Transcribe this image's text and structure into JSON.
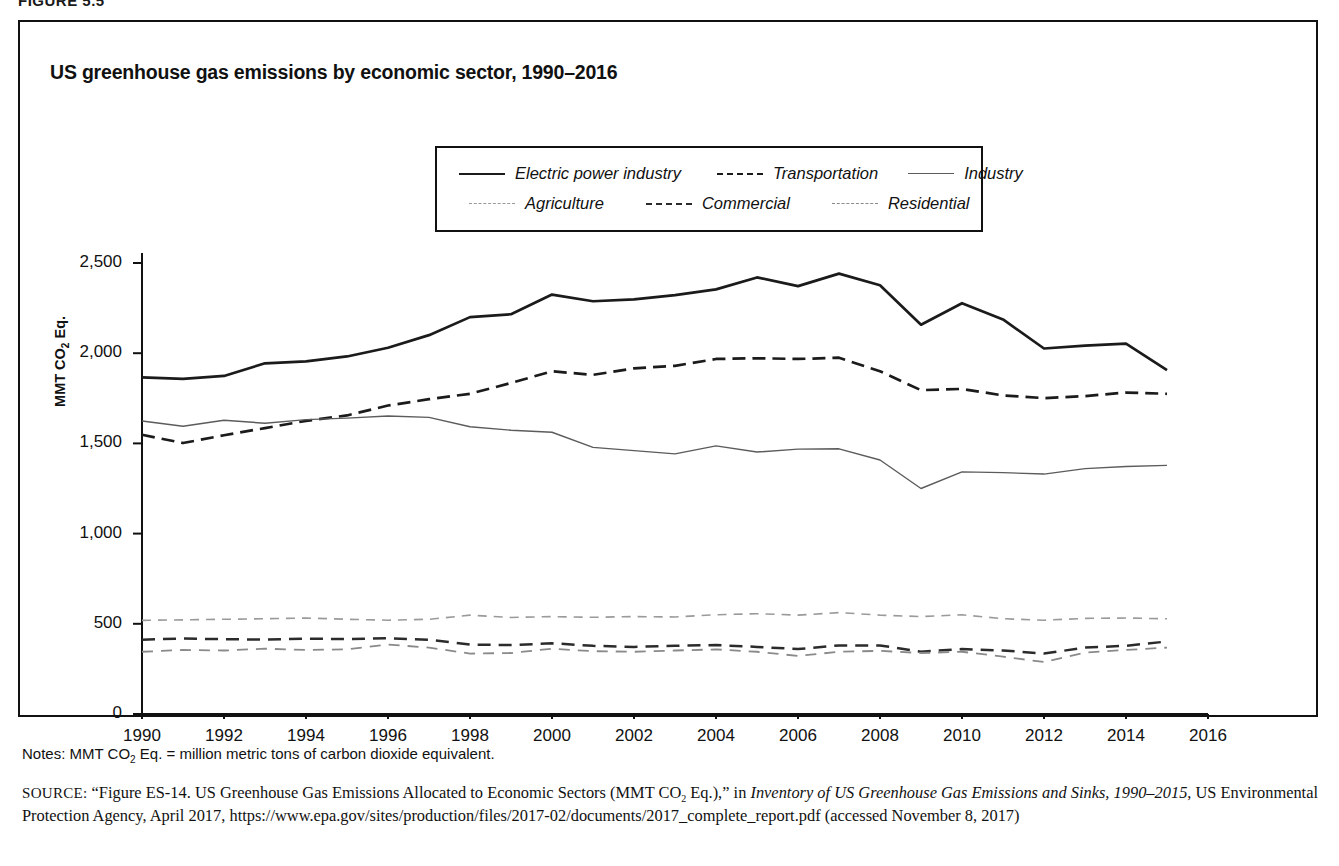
{
  "figure_label": "FIGURE 5.5",
  "title": "US greenhouse gas emissions by economic sector, 1990–2016",
  "legend": {
    "items": [
      {
        "label": "Electric power industry",
        "key": "k-electric"
      },
      {
        "label": "Transportation",
        "key": "k-transport"
      },
      {
        "label": "Industry",
        "key": "k-industry"
      },
      {
        "label": "Agriculture",
        "key": "k-agri"
      },
      {
        "label": "Commercial",
        "key": "k-comm"
      },
      {
        "label": "Residential",
        "key": "k-resid"
      }
    ]
  },
  "notes": {
    "prefix": "Notes: MMT CO",
    "sub": "2",
    "suffix": " Eq. = million metric tons of carbon dioxide equivalent."
  },
  "source": {
    "label": "SOURCE:",
    "part1": " “Figure ES-14. US Greenhouse Gas Emissions Allocated to Economic Sectors (MMT CO",
    "sub1": "2",
    "part2": " Eq.),” in ",
    "italic1": "Inventory of US Greenhouse Gas Emissions and Sinks, 1990–2015",
    "part3": ", US Environmental Protection Agency, April 2017, https://www.epa.gov/sites/production/files/2017-02/documents/2017_complete_report.pdf (accessed November 8, 2017)"
  },
  "chart_data": {
    "type": "line",
    "title": "US greenhouse gas emissions by economic sector, 1990–2016",
    "xlabel": "",
    "ylabel": "MMT CO2 Eq.",
    "xlim": [
      1990,
      2016
    ],
    "ylim": [
      0,
      2500
    ],
    "ytick_labels": [
      "0",
      "500",
      "1,000",
      "1,500",
      "2,000",
      "2,500"
    ],
    "yticks": [
      0,
      500,
      1000,
      1500,
      2000,
      2500
    ],
    "xticks": [
      1990,
      1992,
      1994,
      1996,
      1998,
      2000,
      2002,
      2004,
      2006,
      2008,
      2010,
      2012,
      2014,
      2016
    ],
    "xtick_labels": [
      "1990",
      "1992",
      "1994",
      "1996",
      "1998",
      "2000",
      "2002",
      "2004",
      "2006",
      "2008",
      "2010",
      "2012",
      "2014",
      "2016"
    ],
    "grid": false,
    "legend_position": "top-center",
    "x": [
      1990,
      1991,
      1992,
      1993,
      1994,
      1995,
      1996,
      1997,
      1998,
      1999,
      2000,
      2001,
      2002,
      2003,
      2004,
      2005,
      2006,
      2007,
      2008,
      2009,
      2010,
      2011,
      2012,
      2013,
      2014,
      2015
    ],
    "series": [
      {
        "name": "Electric power industry",
        "style": "solid-thick",
        "color": "#1b1b1b",
        "values": [
          1866,
          1858,
          1874,
          1944,
          1955,
          1982,
          2030,
          2100,
          2200,
          2216,
          2325,
          2288,
          2298,
          2322,
          2354,
          2420,
          2372,
          2441,
          2377,
          2158,
          2277,
          2187,
          2026,
          2042,
          2053,
          1906
        ]
      },
      {
        "name": "Transportation",
        "style": "dashed-bold",
        "color": "#1b1b1b",
        "values": [
          1548,
          1502,
          1545,
          1585,
          1625,
          1655,
          1710,
          1745,
          1775,
          1835,
          1900,
          1880,
          1916,
          1930,
          1968,
          1972,
          1968,
          1975,
          1900,
          1795,
          1802,
          1766,
          1751,
          1762,
          1782,
          1775
        ]
      },
      {
        "name": "Industry",
        "style": "solid-thin",
        "color": "#5c5c5c",
        "values": [
          1624,
          1595,
          1628,
          1612,
          1632,
          1640,
          1652,
          1644,
          1592,
          1573,
          1562,
          1478,
          1460,
          1442,
          1486,
          1452,
          1468,
          1470,
          1408,
          1250,
          1342,
          1338,
          1330,
          1360,
          1372,
          1378
        ]
      },
      {
        "name": "Agriculture",
        "style": "dashed-fine",
        "color": "#9a9a9a",
        "values": [
          519,
          522,
          525,
          528,
          532,
          525,
          520,
          525,
          548,
          535,
          540,
          536,
          540,
          538,
          550,
          556,
          548,
          562,
          548,
          540,
          550,
          528,
          520,
          530,
          532,
          528
        ]
      },
      {
        "name": "Commercial",
        "style": "dashed-medium",
        "color": "#2b2b2b",
        "values": [
          412,
          418,
          415,
          412,
          418,
          415,
          420,
          412,
          385,
          382,
          392,
          378,
          372,
          378,
          382,
          372,
          360,
          380,
          380,
          345,
          360,
          352,
          335,
          368,
          378,
          402
        ]
      },
      {
        "name": "Residential",
        "style": "dashed-light",
        "color": "#8a8a8a",
        "values": [
          345,
          355,
          352,
          362,
          355,
          358,
          385,
          368,
          335,
          338,
          362,
          348,
          345,
          352,
          358,
          345,
          322,
          345,
          350,
          338,
          345,
          318,
          288,
          340,
          355,
          368
        ]
      }
    ]
  }
}
